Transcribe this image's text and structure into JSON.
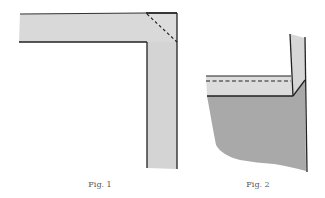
{
  "figures": [
    {
      "id": "fig1",
      "caption": "Fig. 1",
      "description": "Mitered corner: horizontal strip joining vertical strip with dashed diagonal fold line",
      "colors": {
        "strip_fill": "#d9d9d9",
        "outline": "#222222"
      }
    },
    {
      "id": "fig2",
      "caption": "Fig. 2",
      "description": "Folded hem band with dashed stitch line over darker fabric with torn lower edge",
      "colors": {
        "band_fill": "#dcdcdc",
        "fabric_fill": "#a9a9a9",
        "vertical_strip_fill": "#d6d6d6",
        "outline": "#222222"
      }
    }
  ]
}
